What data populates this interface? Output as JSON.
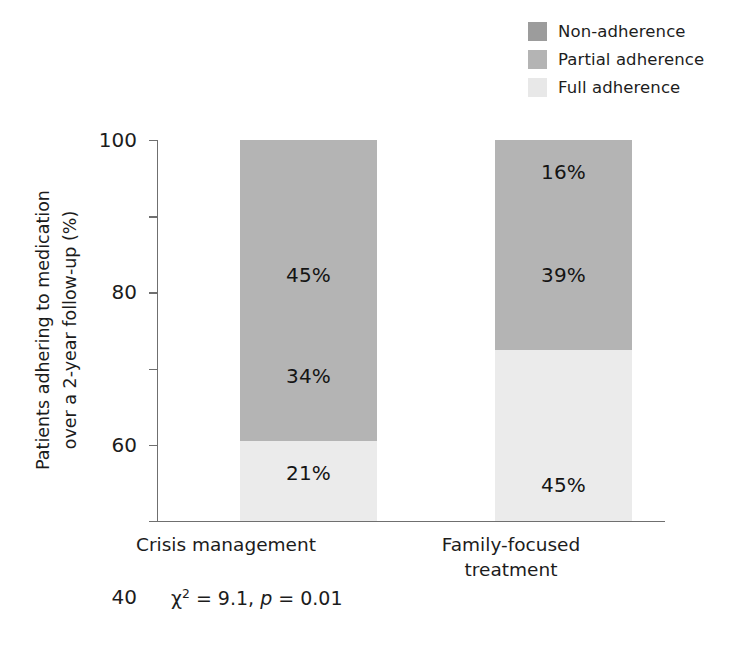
{
  "chart_data": {
    "type": "bar",
    "subtype": "stacked-bar-100",
    "title": "",
    "xlabel": "",
    "ylabel": "Patients adhering to medication over a 2-year follow-up (%)",
    "ylim": [
      0,
      100
    ],
    "yticks": [
      0,
      20,
      40,
      60,
      80,
      100
    ],
    "grid": false,
    "legend_position": "top-right",
    "stack_order_bottom_to_top": [
      "Full adherence",
      "Partial adherence",
      "Non-adherence"
    ],
    "categories": [
      "Crisis management",
      "Family-focused treatment"
    ],
    "series": [
      {
        "name": "Full adherence",
        "values": [
          21,
          45
        ],
        "color": "#ebebeb"
      },
      {
        "name": "Partial adherence",
        "values": [
          34,
          39
        ],
        "color": "#b4b4b4"
      },
      {
        "name": "Non-adherence",
        "values": [
          45,
          16
        ],
        "color": "#b4b4b4"
      }
    ],
    "annotations": [
      "chi-square = 9.1, p = 0.01"
    ]
  },
  "legend": {
    "items": [
      {
        "label": "Non-adherence",
        "color": "#9c9c9c"
      },
      {
        "label": "Partial adherence",
        "color": "#b4b4b4"
      },
      {
        "label": "Full adherence",
        "color": "#e8e8e8"
      }
    ]
  },
  "axes": {
    "y": {
      "title_line1": "Patients adhering to medication",
      "title_line2": "over a 2-year follow-up (%)",
      "ticks": [
        "100",
        "80",
        "60",
        "40",
        "20",
        "0"
      ]
    },
    "x": {
      "categories": [
        {
          "line1": "Crisis management",
          "line2": ""
        },
        {
          "line1": "Family-focused",
          "line2": "treatment"
        }
      ]
    }
  },
  "bars": [
    {
      "category": "Crisis management",
      "segments": [
        {
          "name": "Non-adherence",
          "value": 45,
          "label": "45%",
          "color": "#b4b4b4"
        },
        {
          "name": "Partial adherence",
          "value": 34,
          "label": "34%",
          "color": "#b4b4b4"
        },
        {
          "name": "Full adherence",
          "value": 21,
          "label": "21%",
          "color": "#ebebeb"
        }
      ]
    },
    {
      "category": "Family-focused treatment",
      "segments": [
        {
          "name": "Non-adherence",
          "value": 16,
          "label": "16%",
          "color": "#b4b4b4"
        },
        {
          "name": "Partial adherence",
          "value": 39,
          "label": "39%",
          "color": "#b4b4b4"
        },
        {
          "name": "Full adherence",
          "value": 45,
          "label": "45%",
          "color": "#ebebeb"
        }
      ]
    }
  ],
  "annotation": {
    "chi_symbol": "χ",
    "chi_exponent": "2",
    "chi_equals": " = 9.1, ",
    "p_symbol": "p",
    "p_equals": " = 0.01"
  }
}
